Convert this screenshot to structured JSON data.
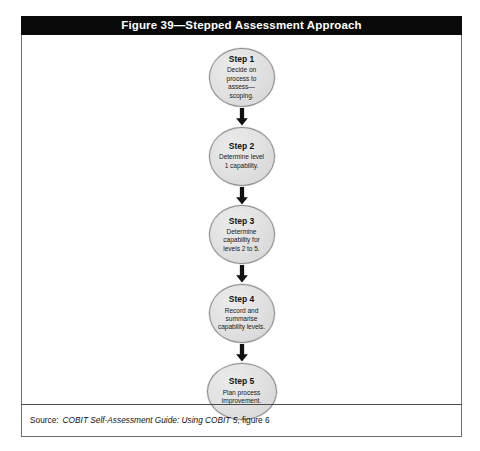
{
  "figure": {
    "title": "Figure 39—Stepped Assessment Approach",
    "steps": [
      {
        "title": "Step 1",
        "description": "Decide on process to assess—scoping."
      },
      {
        "title": "Step 2",
        "description": "Determine level 1 capability."
      },
      {
        "title": "Step 3",
        "description": "Determine capability for levels 2 to 5."
      },
      {
        "title": "Step 4",
        "description": "Record and summarise capability levels."
      },
      {
        "title": "Step 5",
        "description": "Plan process improvement."
      }
    ],
    "arrow_icon": "down-arrow-icon",
    "source": {
      "label": "Source:",
      "title": "COBIT Self-Assessment Guide: Using COBIT 5",
      "reference": ", figure 6"
    }
  },
  "colors": {
    "title_bar_background": "#0a0a0a",
    "title_bar_text": "#ffffff",
    "node_fill": "#e2e2e2",
    "node_border": "#8a8a8a",
    "arrow": "#111111",
    "frame_border": "#6f6f6f",
    "page_background": "#ffffff"
  }
}
